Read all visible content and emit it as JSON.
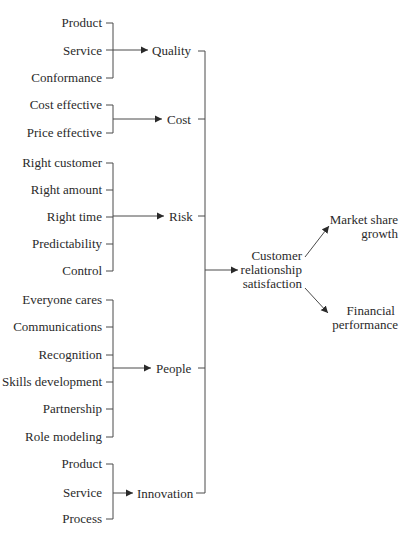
{
  "diagram": {
    "groups": [
      {
        "category": "Quality",
        "items": [
          "Product",
          "Service",
          "Conformance"
        ]
      },
      {
        "category": "Cost",
        "items": [
          "Cost effective",
          "Price effective"
        ]
      },
      {
        "category": "Risk",
        "items": [
          "Right customer",
          "Right amount",
          "Right time",
          "Predictability",
          "Control"
        ]
      },
      {
        "category": "People",
        "items": [
          "Everyone cares",
          "Communications",
          "Recognition",
          "Skills development",
          "Partnership",
          "Role modeling"
        ]
      },
      {
        "category": "Innovation",
        "items": [
          "Product",
          "Service",
          "Process"
        ]
      }
    ],
    "central": {
      "lines": [
        "Customer",
        "relationship",
        "satisfaction"
      ]
    },
    "outcomes": [
      {
        "lines": [
          "Market share",
          "growth"
        ]
      },
      {
        "lines": [
          "Financial",
          "performance"
        ]
      }
    ],
    "colors": {
      "line": "#4a4a4a",
      "text": "#2a2a2a",
      "background": "#ffffff"
    }
  }
}
